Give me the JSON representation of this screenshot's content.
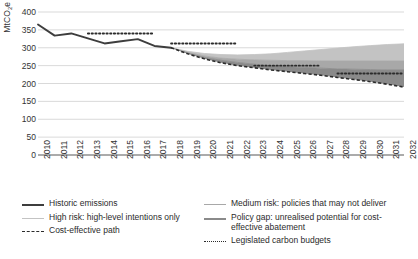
{
  "chart_data": {
    "type": "area",
    "title": "",
    "xlabel": "",
    "ylabel": "MtCO2e per year",
    "ylabel_prefix": "MtCO",
    "ylabel_sub": "2",
    "ylabel_suffix": "e per year",
    "ylim": [
      0,
      400
    ],
    "ytick_step": 50,
    "yticks": [
      "0",
      "50",
      "100",
      "150",
      "200",
      "250",
      "300",
      "350",
      "400"
    ],
    "grid": true,
    "legend_position": "bottom",
    "x": [
      2010,
      2011,
      2012,
      2013,
      2014,
      2015,
      2016,
      2017,
      2018,
      2019,
      2020,
      2021,
      2022,
      2023,
      2024,
      2025,
      2026,
      2027,
      2028,
      2029,
      2030,
      2031,
      2032
    ],
    "categories": [
      "2010",
      "2011",
      "2012",
      "2013",
      "2014",
      "2015",
      "2016",
      "2017",
      "2018",
      "2019",
      "2020",
      "2021",
      "2022",
      "2023",
      "2024",
      "2025",
      "2026",
      "2027",
      "2028",
      "2029",
      "2030",
      "2031",
      "2032"
    ],
    "series": [
      {
        "name": "Historic emissions",
        "type": "line",
        "style": "solid",
        "color": "#3d3d3d",
        "width": 1.9,
        "x": [
          2010,
          2011,
          2012,
          2013,
          2014,
          2015,
          2016,
          2017,
          2018
        ],
        "values": [
          365,
          334,
          340,
          326,
          312,
          318,
          324,
          305,
          300
        ]
      },
      {
        "name": "High risk: high-level intentions only",
        "type": "area_top",
        "color": "#c3c3c3",
        "x": [
          2018,
          2019,
          2020,
          2021,
          2022,
          2023,
          2024,
          2025,
          2026,
          2027,
          2028,
          2029,
          2030,
          2031,
          2032
        ],
        "values": [
          300,
          290,
          284,
          281,
          280,
          281,
          283,
          287,
          291,
          295,
          299,
          303,
          306,
          309,
          311
        ]
      },
      {
        "name": "Medium risk: policies that may not deliver",
        "type": "area_mid",
        "color": "#a8a8a8",
        "x": [
          2018,
          2019,
          2020,
          2021,
          2022,
          2023,
          2024,
          2025,
          2026,
          2027,
          2028,
          2029,
          2030,
          2031,
          2032
        ],
        "values": [
          300,
          287,
          277,
          271,
          268,
          266,
          265,
          264,
          264,
          263,
          263,
          263,
          263,
          263,
          263
        ]
      },
      {
        "name": "Policy gap: unrealised potential for cost-effective abatement",
        "type": "area_low",
        "color": "#8a8a8a",
        "x": [
          2018,
          2019,
          2020,
          2021,
          2022,
          2023,
          2024,
          2025,
          2026,
          2027,
          2028,
          2029,
          2030,
          2031,
          2032
        ],
        "values": [
          300,
          285,
          273,
          265,
          259,
          254,
          250,
          247,
          245,
          243,
          241,
          240,
          239,
          238,
          238
        ]
      },
      {
        "name": "Cost-effective path",
        "type": "line",
        "style": "dashed",
        "color": "#2b2b2b",
        "width": 1.6,
        "x": [
          2018,
          2019,
          2020,
          2021,
          2022,
          2023,
          2024,
          2025,
          2026,
          2027,
          2028,
          2029,
          2030,
          2031,
          2032
        ],
        "values": [
          300,
          283,
          269,
          258,
          250,
          244,
          238,
          233,
          228,
          223,
          217,
          211,
          205,
          198,
          190
        ]
      }
    ],
    "budget_segments": [
      {
        "name": "Second carbon budget",
        "start": 2013,
        "end": 2017,
        "value": 340
      },
      {
        "name": "Third carbon budget",
        "start": 2018,
        "end": 2022,
        "value": 312
      },
      {
        "name": "Fourth carbon budget",
        "start": 2023,
        "end": 2027,
        "value": 250
      },
      {
        "name": "Fifth carbon budget",
        "start": 2028,
        "end": 2032,
        "value": 228
      }
    ],
    "budget_series_name": "Legislated carbon budgets",
    "budget_color": "#2b2b2b"
  },
  "legend": {
    "left": [
      {
        "label": "Historic emissions",
        "style": "solid-thick",
        "color": "#3d3d3d"
      },
      {
        "label": "High risk: high-level intentions only",
        "style": "solid-thin",
        "color": "#c3c3c3"
      },
      {
        "label": "Cost-effective path",
        "style": "dashed",
        "color": "#2b2b2b"
      }
    ],
    "right": [
      {
        "label": "Medium risk: policies that may not deliver",
        "style": "solid-thin",
        "color": "#a8a8a8"
      },
      {
        "label": "Policy gap: unrealised potential for cost-effective abatement",
        "style": "solid-thick",
        "color": "#8a8a8a"
      },
      {
        "label": "Legislated carbon budgets",
        "style": "dotted",
        "color": "#2b2b2b"
      }
    ]
  }
}
